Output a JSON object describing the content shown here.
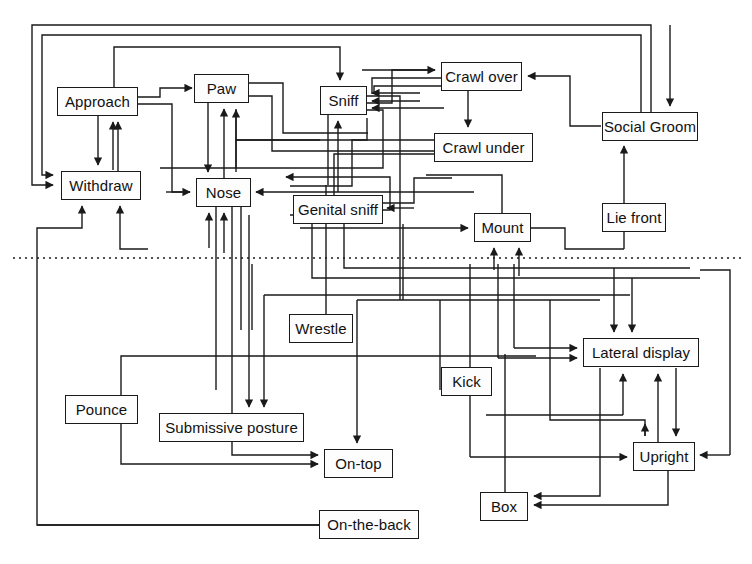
{
  "diagram": {
    "type": "flow-network",
    "width": 752,
    "height": 564,
    "background_color": "#ffffff",
    "line_color": "#1a1a1a",
    "node_fill": "#fdfdfd",
    "divider": {
      "name": "dotted-divider",
      "style": "dotted",
      "y": 258,
      "x_start": 13,
      "x_end": 745
    },
    "nodes": [
      {
        "id": "approach",
        "label": "Approach",
        "x": 57,
        "y": 87,
        "w": 81,
        "h": 29,
        "group": "upper"
      },
      {
        "id": "withdraw",
        "label": "Withdraw",
        "x": 61,
        "y": 171,
        "w": 80,
        "h": 29,
        "group": "upper"
      },
      {
        "id": "paw",
        "label": "Paw",
        "x": 194,
        "y": 74,
        "w": 55,
        "h": 29,
        "group": "upper"
      },
      {
        "id": "nose",
        "label": "Nose",
        "x": 196,
        "y": 178,
        "w": 55,
        "h": 29,
        "group": "upper"
      },
      {
        "id": "sniff",
        "label": "Sniff",
        "x": 320,
        "y": 86,
        "w": 47,
        "h": 29,
        "group": "upper"
      },
      {
        "id": "crawlover",
        "label": "Crawl over",
        "x": 441,
        "y": 62,
        "w": 81,
        "h": 29,
        "group": "upper"
      },
      {
        "id": "crawlunder",
        "label": "Crawl under",
        "x": 434,
        "y": 133,
        "w": 99,
        "h": 29,
        "group": "upper"
      },
      {
        "id": "socialgroom",
        "label": "Social Groom",
        "x": 602,
        "y": 112,
        "w": 96,
        "h": 29,
        "group": "upper"
      },
      {
        "id": "genitalsniff",
        "label": "Genital sniff",
        "x": 293,
        "y": 195,
        "w": 90,
        "h": 29,
        "group": "upper"
      },
      {
        "id": "mount",
        "label": "Mount",
        "x": 474,
        "y": 213,
        "w": 57,
        "h": 29,
        "group": "upper"
      },
      {
        "id": "liefront",
        "label": "Lie front",
        "x": 602,
        "y": 203,
        "w": 64,
        "h": 29,
        "group": "upper"
      },
      {
        "id": "wrestle",
        "label": "Wrestle",
        "x": 289,
        "y": 314,
        "w": 64,
        "h": 29,
        "group": "lower"
      },
      {
        "id": "kick",
        "label": "Kick",
        "x": 441,
        "y": 367,
        "w": 51,
        "h": 29,
        "group": "lower"
      },
      {
        "id": "pounce",
        "label": "Pounce",
        "x": 65,
        "y": 395,
        "w": 73,
        "h": 29,
        "group": "lower"
      },
      {
        "id": "submissive",
        "label": "Submissive posture",
        "x": 159,
        "y": 413,
        "w": 145,
        "h": 29,
        "group": "lower"
      },
      {
        "id": "ontop",
        "label": "On-top",
        "x": 324,
        "y": 449,
        "w": 69,
        "h": 29,
        "group": "lower"
      },
      {
        "id": "lateral",
        "label": "Lateral display",
        "x": 583,
        "y": 338,
        "w": 116,
        "h": 29,
        "group": "lower"
      },
      {
        "id": "upright",
        "label": "Upright",
        "x": 633,
        "y": 442,
        "w": 62,
        "h": 29,
        "group": "lower"
      },
      {
        "id": "box",
        "label": "Box",
        "x": 480,
        "y": 492,
        "w": 48,
        "h": 29,
        "group": "lower"
      },
      {
        "id": "ontheback",
        "label": "On-the-back",
        "x": 319,
        "y": 510,
        "w": 100,
        "h": 29,
        "group": "lower"
      }
    ],
    "edges": [
      {
        "from": "socialgroom",
        "to": "withdraw",
        "points": "650,112 650,25 32,25 32,185 55,185",
        "arrow": "right"
      },
      {
        "from": "socialgroom",
        "to": "approach",
        "points": "641,112 641,35 41,35 41,174 55,174",
        "arrow": "right"
      },
      {
        "from": "sniff",
        "to": "paw",
        "points": "",
        "arrow": ""
      },
      {
        "from": "approach",
        "to": "sniff",
        "points": "111,87 111,48 338,48 338,82",
        "arrow": "down"
      },
      {
        "from": "approach",
        "to": "withdraw",
        "points": "97,116 97,165",
        "arrow": "down"
      },
      {
        "from": "withdraw",
        "to": "approach",
        "points": "97,171 97,120",
        "arrow": "up"
      },
      {
        "from": "paw",
        "to": "nose",
        "points": "207,103 207,172",
        "arrow": "down"
      },
      {
        "from": "sniff",
        "to": "nose",
        "points": "",
        "arrow": ""
      },
      {
        "from": "crawlover",
        "to": "crawlunder",
        "points": "468,91 468,127",
        "arrow": "down"
      },
      {
        "from": "mount",
        "to": "socialgroom",
        "points": "",
        "arrow": "up"
      },
      {
        "from": "lateral",
        "to": "upright",
        "points": "",
        "arrow": "down"
      },
      {
        "from": "upright",
        "to": "lateral",
        "points": "",
        "arrow": "up"
      },
      {
        "from": "upright",
        "to": "box",
        "points": "",
        "arrow": "left"
      },
      {
        "from": "pounce",
        "to": "ontop",
        "points": "",
        "arrow": "right"
      },
      {
        "from": "ontheback",
        "to": "withdraw",
        "points": "",
        "arrow": "up"
      }
    ]
  }
}
